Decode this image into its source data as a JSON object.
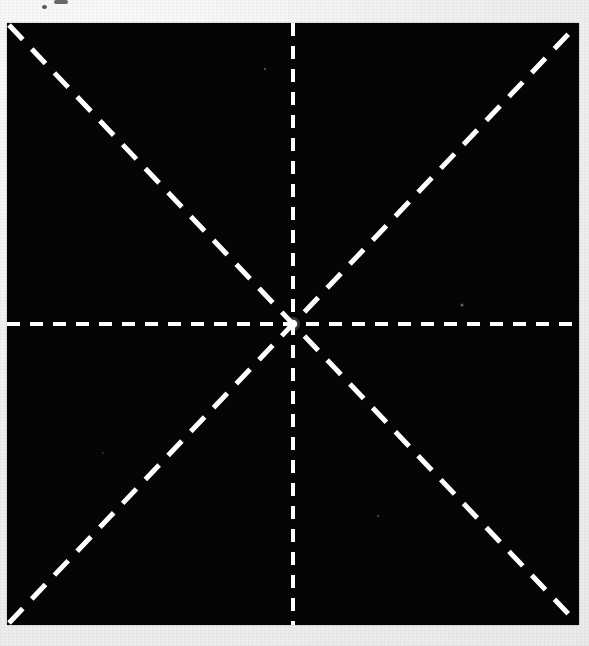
{
  "figure": {
    "description": "A solid black rectangular plate on light gray scanned paper, overlaid with four white dashed lines passing through a common center, producing eight radiating dashed spokes.",
    "background_color": "#efefef",
    "plate_color": "#050505",
    "line_color": "#ffffff",
    "plate": {
      "left": 7,
      "top": 23,
      "width": 572,
      "height": 602
    },
    "center_point": {
      "label": "center",
      "x": 286,
      "y": 301,
      "page_x": 293,
      "page_y": 324
    },
    "line_style": {
      "stroke": "#ffffff",
      "dash_length_axis": 13,
      "gap_length_axis": 10,
      "dash_length_diagonal": 20,
      "gap_length_diagonal": 13,
      "width_axis": 4,
      "width_diagonal": 5
    },
    "spokes": [
      {
        "name": "axis-horizontal",
        "angle_deg": 0,
        "orientation": "horizontal",
        "style": "dashed"
      },
      {
        "name": "axis-vertical",
        "angle_deg": 90,
        "orientation": "vertical",
        "style": "dashed"
      },
      {
        "name": "diagonal-nw-se",
        "angle_deg": 135,
        "orientation": "diagonal",
        "style": "dashed"
      },
      {
        "name": "diagonal-sw-ne",
        "angle_deg": 45,
        "orientation": "diagonal",
        "style": "dashed"
      }
    ],
    "artifacts": [
      {
        "name": "top-edge-mark",
        "x": 54,
        "y": 0,
        "w": 14,
        "h": 4,
        "tone": "dark"
      },
      {
        "name": "speck-upper-left-paper",
        "x": 42,
        "y": 6,
        "r": 2,
        "tone": "dark"
      },
      {
        "name": "speck-plate-right",
        "x": 462,
        "y": 305,
        "r": 2,
        "tone": "light"
      },
      {
        "name": "speck-plate-upper",
        "x": 265,
        "y": 69,
        "r": 1,
        "tone": "light"
      },
      {
        "name": "speck-plate-lower",
        "x": 378,
        "y": 516,
        "r": 1,
        "tone": "light"
      }
    ]
  },
  "chart_data": {
    "type": "line",
    "xlabel": "",
    "ylabel": "",
    "grid": false,
    "legend": "none",
    "xlim": [
      -286,
      286
    ],
    "ylim": [
      -301,
      301
    ],
    "series": [
      {
        "name": "axis-horizontal",
        "linestyle": "dashed",
        "color": "#ffffff",
        "x": [
          -286,
          286
        ],
        "y": [
          0,
          0
        ]
      },
      {
        "name": "axis-vertical",
        "linestyle": "dashed",
        "color": "#ffffff",
        "x": [
          0,
          0
        ],
        "y": [
          -301,
          301
        ]
      },
      {
        "name": "diagonal-sw-ne",
        "linestyle": "dashed",
        "color": "#ffffff",
        "x": [
          -286,
          286
        ],
        "y": [
          -301,
          301
        ]
      },
      {
        "name": "diagonal-nw-se",
        "linestyle": "dashed",
        "color": "#ffffff",
        "x": [
          -286,
          286
        ],
        "y": [
          301,
          -301
        ]
      }
    ]
  }
}
